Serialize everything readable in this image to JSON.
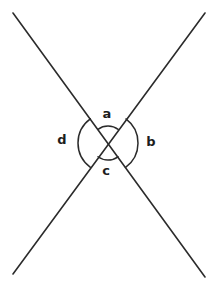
{
  "figure": {
    "background_color": "#ffffff",
    "stroke_color": "#2b2b2b",
    "label_color": "#1d1d1d",
    "width": 215,
    "height": 287
  },
  "geometry": {
    "intersection": {
      "x": 108,
      "y": 143
    },
    "lines": [
      {
        "name": "line-top-left-to-bottom-right",
        "x1": 13,
        "y1": 13,
        "x2": 205,
        "y2": 277
      },
      {
        "name": "line-top-right-to-bottom-left",
        "x1": 205,
        "y1": 13,
        "x2": 13,
        "y2": 274
      }
    ],
    "arcs": [
      {
        "name": "arc-a",
        "position": "top",
        "radius": 17
      },
      {
        "name": "arc-b",
        "position": "right",
        "radius": 30
      },
      {
        "name": "arc-c",
        "position": "bottom",
        "radius": 17
      },
      {
        "name": "arc-d",
        "position": "left",
        "radius": 30
      }
    ]
  },
  "labels": {
    "a": {
      "text": "a",
      "x": 107,
      "y": 114
    },
    "b": {
      "text": "b",
      "x": 151,
      "y": 142
    },
    "c": {
      "text": "c",
      "x": 106,
      "y": 171
    },
    "d": {
      "text": "d",
      "x": 62,
      "y": 140
    }
  }
}
